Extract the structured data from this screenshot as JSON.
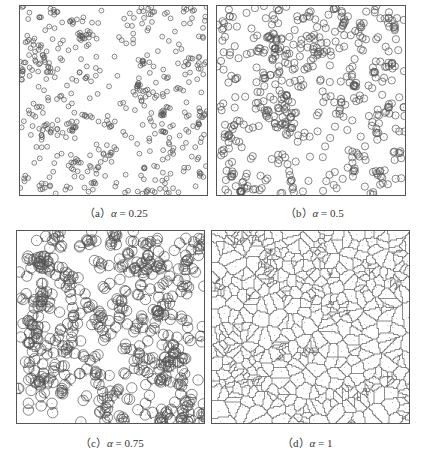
{
  "figure": {
    "panels": [
      {
        "id": "a",
        "label": "（a）",
        "alpha_symbol": "α",
        "value_text": " = 0.25",
        "alpha": 0.25,
        "mode": "circles-small"
      },
      {
        "id": "b",
        "label": "（b）",
        "alpha_symbol": "α",
        "value_text": " = 0.5",
        "alpha": 0.5,
        "mode": "circles-medium"
      },
      {
        "id": "c",
        "label": "（c）",
        "alpha_symbol": "α",
        "value_text": " = 0.75",
        "alpha": 0.75,
        "mode": "circles-voronoi"
      },
      {
        "id": "d",
        "label": "（d）",
        "alpha_symbol": "α",
        "value_text": " = 1",
        "alpha": 1,
        "mode": "voronoi"
      }
    ],
    "colors": {
      "stroke": "#555555",
      "frame": "#555555",
      "text": "#333333",
      "background": "#ffffff"
    }
  }
}
